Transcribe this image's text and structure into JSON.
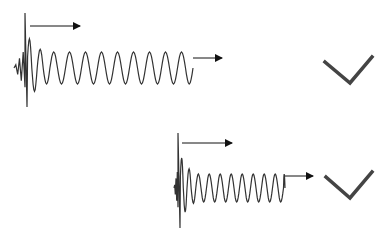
{
  "diagram": {
    "background": "#ffffff",
    "colors": {
      "wave": "#333333",
      "arrow": "#111111",
      "check": "#444444"
    },
    "panels": [
      {
        "id": "top",
        "wave": {
          "x_start": 14,
          "x_spike": 25,
          "x_end": 193,
          "center_y": 68,
          "spike_top": 13,
          "spike_bottom": 107,
          "steady_amplitude": 16,
          "steady_period": 16
        },
        "arrows": [
          {
            "x1": 30,
            "y1": 26,
            "x2": 80,
            "y2": 26
          },
          {
            "x1": 193,
            "y1": 58,
            "x2": 222,
            "y2": 58
          }
        ],
        "check": {
          "points": [
            [
              325,
              62
            ],
            [
              350,
              83
            ],
            [
              372,
              57
            ]
          ]
        }
      },
      {
        "id": "bottom",
        "wave": {
          "x_start": 174,
          "x_spike": 178,
          "x_end": 285,
          "center_y": 188,
          "spike_top": 133,
          "spike_bottom": 228,
          "steady_amplitude": 14,
          "steady_period": 11
        },
        "arrows": [
          {
            "x1": 182,
            "y1": 143,
            "x2": 232,
            "y2": 143
          },
          {
            "x1": 285,
            "y1": 176,
            "x2": 313,
            "y2": 176
          }
        ],
        "check": {
          "points": [
            [
              326,
              177
            ],
            [
              350,
              198
            ],
            [
              372,
              172
            ]
          ]
        }
      }
    ]
  }
}
